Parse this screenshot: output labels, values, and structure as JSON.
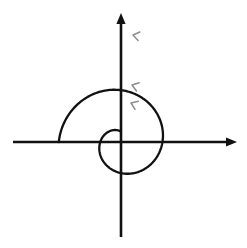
{
  "figure": {
    "background_color": "#ffffff",
    "width": 247,
    "height": 248,
    "curve_color": "#111111",
    "axis_color": "#111111",
    "arrow_marker_color": "#8d8d8d"
  },
  "axes": {
    "origin": {
      "x": 121,
      "y": 142
    },
    "x_axis": {
      "name": "x-axis",
      "start": {
        "x": 13,
        "y": 142
      },
      "end": {
        "x": 237,
        "y": 142
      },
      "arrowhead": "right",
      "tick_labels": [],
      "label": ""
    },
    "y_axis": {
      "name": "y-axis",
      "start": {
        "x": 121,
        "y": 237
      },
      "end": {
        "x": 121,
        "y": 13
      },
      "arrowhead": "up",
      "tick_labels": [],
      "label": ""
    }
  },
  "chart_data": {
    "type": "line",
    "title": "",
    "subtitle": "",
    "xlabel": "",
    "ylabel": "",
    "grid": false,
    "legend": [],
    "annotations": [],
    "curve": {
      "name": "archimedean-spiral",
      "equation": "r = a*theta",
      "coordinate_system": "polar",
      "direction": "counterclockwise-outward",
      "a": 6.6,
      "theta_start_deg": 90,
      "theta_end_deg": 540,
      "samples": 260
    },
    "crossings": {
      "positive_y_axis_px": [
        36,
        85,
        103
      ],
      "negative_x_axis_px": [
        31,
        70
      ],
      "positive_x_axis_px": [
        165,
        188
      ],
      "negative_y_axis_px": [
        212,
        187
      ]
    },
    "endpoints": {
      "inner_start_px": {
        "x": 98,
        "y": 104
      },
      "outer_end_px": {
        "x": 206,
        "y": 58
      }
    },
    "direction_markers": [
      {
        "name": "chevron-outer",
        "x": 133,
        "y": 35,
        "angle_deg": 12
      },
      {
        "name": "chevron-middle",
        "x": 132,
        "y": 85,
        "angle_deg": 18
      },
      {
        "name": "chevron-inner",
        "x": 131,
        "y": 103,
        "angle_deg": 22
      }
    ]
  }
}
